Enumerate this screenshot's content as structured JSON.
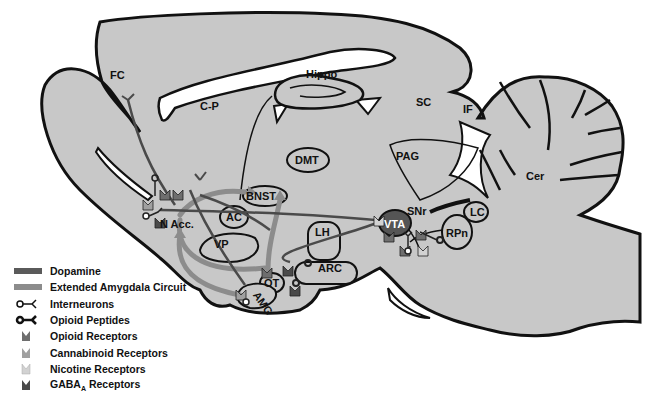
{
  "diagram": {
    "colors": {
      "brain_fill": "#c8c8c8",
      "outline": "#111111",
      "dopamine": "#5a5a5a",
      "extended_amygdala": "#8c8c8c",
      "vta_fill": "#555555",
      "background": "#ffffff"
    },
    "regions": {
      "fc": "FC",
      "cp": "C-P",
      "hippo": "Hippo",
      "sc": "SC",
      "if": "IF",
      "dmt": "DMT",
      "pag": "PAG",
      "cer": "Cer",
      "bnst": "BNST",
      "nacc": "N Acc.",
      "ac": "AC",
      "lh": "LH",
      "vta": "VTA",
      "snr": "SNr",
      "lc": "LC",
      "rpn": "RPn",
      "vp": "VP",
      "ot": "OT",
      "arc": "ARC",
      "amg": "AMG"
    }
  },
  "legend": {
    "items": [
      {
        "icon": "dopamine-line",
        "label": "Dopamine"
      },
      {
        "icon": "extended-amygdala-line",
        "label": "Extended Amygdala Circuit"
      },
      {
        "icon": "interneuron-symbol",
        "label": "Interneurons"
      },
      {
        "icon": "opioid-peptide-symbol",
        "label": "Opioid Peptides"
      },
      {
        "icon": "opioid-receptor-symbol",
        "label": "Opioid Receptors"
      },
      {
        "icon": "cannabinoid-receptor-symbol",
        "label": "Cannabinoid Receptors"
      },
      {
        "icon": "nicotine-receptor-symbol",
        "label": "Nicotine Receptors"
      },
      {
        "icon": "gaba-a-receptor-symbol",
        "label_main": "GABA",
        "label_sub": "A",
        "label_rest": " Receptors"
      }
    ],
    "receptor_colors": {
      "opioid": "#6e6e6e",
      "cannabinoid": "#a0a0a0",
      "nicotine": "#d2d2d2",
      "gaba_a": "#4a4a4a"
    }
  }
}
